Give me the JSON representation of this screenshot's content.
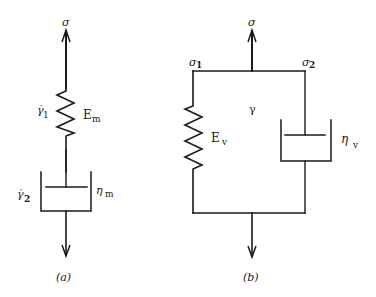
{
  "diagram": {
    "type": "rheological-models",
    "panels": [
      {
        "id": "a",
        "caption": "(a)",
        "model": "series spring-dashpot (Maxwell)",
        "load_label": "σ",
        "spring": {
          "symbol": "E",
          "subscript": "m",
          "strain_rate_symbol": "γ̇",
          "strain_rate_subscript": "1"
        },
        "dashpot": {
          "symbol": "η",
          "subscript": "m",
          "strain_rate_symbol": "γ̇",
          "strain_rate_subscript": "2"
        }
      },
      {
        "id": "b",
        "caption": "(b)",
        "model": "parallel spring-dashpot (Kelvin-Voigt)",
        "load_label": "σ",
        "branch_stress_left": {
          "symbol": "σ",
          "subscript": "1"
        },
        "branch_stress_right": {
          "symbol": "σ",
          "subscript": "2"
        },
        "strain_label": "γ",
        "spring": {
          "symbol": "E",
          "subscript": "v"
        },
        "dashpot": {
          "symbol": "η",
          "subscript": "v"
        }
      }
    ]
  },
  "colors": {
    "ink": "#1a1a1a",
    "background": "#ffffff"
  }
}
